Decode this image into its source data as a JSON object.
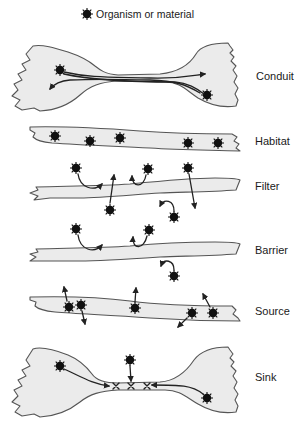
{
  "legend": {
    "icon": "organism-starburst-icon",
    "text": "Organism or material"
  },
  "functions": [
    {
      "id": "conduit",
      "label": "Conduit"
    },
    {
      "id": "habitat",
      "label": "Habitat"
    },
    {
      "id": "filter",
      "label": "Filter"
    },
    {
      "id": "barrier",
      "label": "Barrier"
    },
    {
      "id": "source",
      "label": "Source"
    },
    {
      "id": "sink",
      "label": "Sink"
    }
  ],
  "colors": {
    "corridor_fill": "#ebebeb",
    "outline": "#555555",
    "organism": "#111111"
  }
}
